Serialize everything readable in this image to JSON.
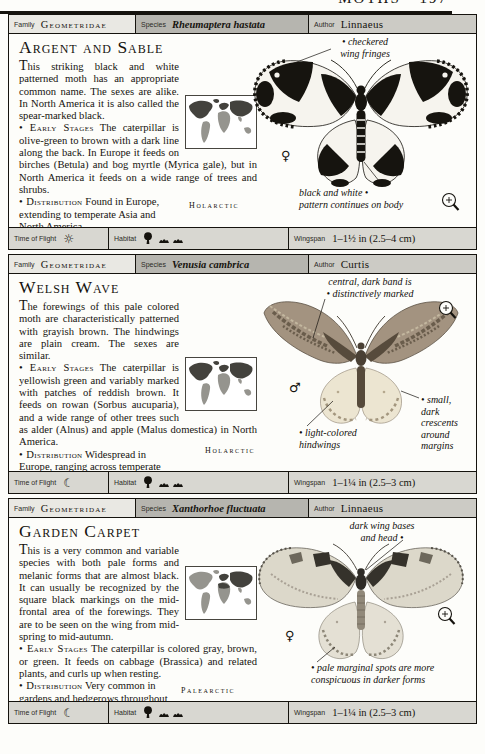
{
  "page": {
    "running_head": "MOTHS • 197"
  },
  "labels": {
    "family": "Family",
    "species": "Species",
    "author": "Author",
    "time_of_flight": "Time of Flight",
    "habitat": "Habitat",
    "wingspan": "Wingspan"
  },
  "icons": {
    "map": "distribution-map",
    "magnifier": "magnifier",
    "tree": "tree-habitat",
    "scrub": "scrub-habitat"
  },
  "entries": [
    {
      "family": "Geometridae",
      "species": "Rheumaptera hastata",
      "author": "Linnaeus",
      "title": "Argent and Sable",
      "intro": "This striking black and white patterned moth has an appropriate common name. The sexes are alike. In North America it is also called the spear-marked black.",
      "early_head": "Early Stages",
      "early": "The caterpillar is olive-green to brown with a dark line along the back. In Europe it feeds on birches (Betula) and bog myrtle (Myrica gale), but in North America it feeds on a wide range of trees and shrubs.",
      "dist_head": "Distribution",
      "dist": "Found in Europe, extending to temperate Asia and North America.",
      "map_caption": "Holarctic",
      "sex_symbol": "♀",
      "time_icon": "☼",
      "wingspan": "1–1½ in (2.5–4 cm)",
      "annotations": {
        "a1": {
          "line1": "• checkered",
          "line2": "wing fringes"
        },
        "a2": {
          "line1": "black and white •",
          "line2": "pattern continues on body"
        }
      }
    },
    {
      "family": "Geometridae",
      "species": "Venusia cambrica",
      "author": "Curtis",
      "title": "Welsh Wave",
      "intro": "The forewings of this pale colored moth are characteristically patterned with grayish brown. The hindwings are plain cream. The sexes are similar.",
      "early_head": "Early Stages",
      "early": "The caterpillar is yellowish green and variably marked with patches of reddish brown. It feeds on rowan (Sorbus aucuparia), and a wide range of other trees such as alder (Alnus) and apple (Malus domestica) in North America.",
      "dist_head": "Distribution",
      "dist": "Widespread in Europe, ranging across temperate Asia to Japan. Also occurs in Canada and northern USA.",
      "map_caption": "Holarctic",
      "sex_symbol": "♂",
      "time_icon": "☾",
      "wingspan": "1–1¼ in (2.5–3 cm)",
      "annotations": {
        "a1": {
          "line1": "central, dark band is",
          "line2": "• distinctively marked"
        },
        "a2": {
          "line1": "• small,",
          "line2": "dark",
          "line3": "crescents",
          "line4": "around",
          "line5": "margins"
        },
        "a3": {
          "line1": "• light-colored",
          "line2": "hindwings"
        }
      }
    },
    {
      "family": "Geometridae",
      "species": "Xanthorhoe fluctuata",
      "author": "Linnaeus",
      "title": "Garden Carpet",
      "intro": "This is a very common and variable species with both pale forms and melanic forms that are almost black. It can usually be recognized by the square black markings on the mid-frontal area of the forewings. They are to be seen on the wing from mid-spring to mid-autumn.",
      "early_head": "Early Stages",
      "early": "The caterpillar is colored gray, brown, or green. It feeds on cabbage (Brassica) and related plants, and curls up when resting.",
      "dist_head": "Distribution",
      "dist": "Very common in gardens and hedgerows throughout Europe, ranging to North Africa and Japan.",
      "map_caption": "Palearctic",
      "sex_symbol": "♀",
      "time_icon": "☾",
      "wingspan": "1–1¼ in (2.5–3 cm)",
      "annotations": {
        "a1": {
          "line1": "dark wing bases",
          "line2": "and head •"
        },
        "a2": {
          "line1": "• pale marginal spots are more",
          "line2": "conspicuous in darker forms"
        }
      }
    }
  ]
}
